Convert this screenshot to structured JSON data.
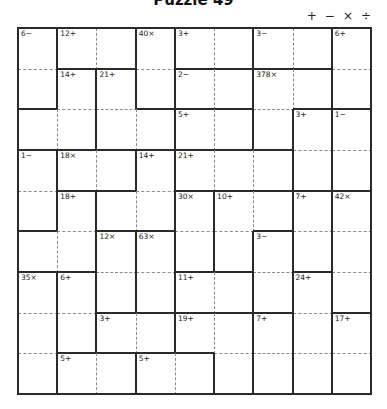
{
  "title": "Puzzle 49",
  "operators": [
    {
      "name": "plus-icon",
      "symbol": "+"
    },
    {
      "name": "minus-icon",
      "symbol": "−"
    },
    {
      "name": "times-icon",
      "symbol": "×"
    },
    {
      "name": "divide-icon",
      "symbol": "÷"
    }
  ],
  "grid": {
    "size": 9,
    "colors": {
      "thick": "#2a2a2a",
      "thin": "#8a8a8a",
      "clue": "#222222",
      "background": "#ffffff"
    },
    "cages": [
      {
        "clue": "6−",
        "cells": [
          [
            0,
            0
          ],
          [
            1,
            0
          ]
        ]
      },
      {
        "clue": "12+",
        "cells": [
          [
            0,
            1
          ],
          [
            0,
            2
          ]
        ]
      },
      {
        "clue": "40×",
        "cells": [
          [
            0,
            3
          ],
          [
            1,
            3
          ]
        ]
      },
      {
        "clue": "3+",
        "cells": [
          [
            0,
            4
          ],
          [
            0,
            5
          ]
        ]
      },
      {
        "clue": "3−",
        "cells": [
          [
            0,
            6
          ],
          [
            0,
            7
          ]
        ]
      },
      {
        "clue": "6+",
        "cells": [
          [
            0,
            8
          ],
          [
            1,
            8
          ]
        ]
      },
      {
        "clue": "14+",
        "cells": [
          [
            1,
            1
          ],
          [
            2,
            1
          ],
          [
            2,
            0
          ]
        ]
      },
      {
        "clue": "21+",
        "cells": [
          [
            1,
            2
          ],
          [
            2,
            2
          ],
          [
            2,
            3
          ]
        ]
      },
      {
        "clue": "2−",
        "cells": [
          [
            1,
            4
          ],
          [
            1,
            5
          ]
        ]
      },
      {
        "clue": "378×",
        "cells": [
          [
            1,
            6
          ],
          [
            1,
            7
          ],
          [
            2,
            6
          ]
        ]
      },
      {
        "clue": "5+",
        "cells": [
          [
            2,
            4
          ],
          [
            2,
            5
          ]
        ]
      },
      {
        "clue": "3+",
        "cells": [
          [
            2,
            7
          ],
          [
            3,
            7
          ]
        ]
      },
      {
        "clue": "1−",
        "cells": [
          [
            2,
            8
          ],
          [
            3,
            8
          ]
        ]
      },
      {
        "clue": "1−",
        "cells": [
          [
            3,
            0
          ],
          [
            4,
            0
          ]
        ]
      },
      {
        "clue": "18×",
        "cells": [
          [
            3,
            1
          ],
          [
            3,
            2
          ]
        ]
      },
      {
        "clue": "14+",
        "cells": [
          [
            3,
            3
          ],
          [
            4,
            3
          ],
          [
            4,
            2
          ]
        ]
      },
      {
        "clue": "21+",
        "cells": [
          [
            3,
            4
          ],
          [
            3,
            5
          ],
          [
            3,
            6
          ]
        ]
      },
      {
        "clue": "18+",
        "cells": [
          [
            4,
            1
          ],
          [
            5,
            1
          ],
          [
            5,
            0
          ]
        ]
      },
      {
        "clue": "30×",
        "cells": [
          [
            4,
            4
          ],
          [
            5,
            4
          ]
        ]
      },
      {
        "clue": "10+",
        "cells": [
          [
            4,
            5
          ],
          [
            4,
            6
          ],
          [
            5,
            5
          ]
        ]
      },
      {
        "clue": "7+",
        "cells": [
          [
            4,
            7
          ],
          [
            5,
            7
          ]
        ]
      },
      {
        "clue": "42×",
        "cells": [
          [
            4,
            8
          ],
          [
            5,
            8
          ],
          [
            6,
            8
          ]
        ]
      },
      {
        "clue": "12×",
        "cells": [
          [
            5,
            2
          ],
          [
            6,
            2
          ]
        ]
      },
      {
        "clue": "63×",
        "cells": [
          [
            5,
            3
          ],
          [
            6,
            3
          ]
        ]
      },
      {
        "clue": "3−",
        "cells": [
          [
            5,
            6
          ],
          [
            6,
            6
          ]
        ]
      },
      {
        "clue": "35×",
        "cells": [
          [
            6,
            0
          ],
          [
            7,
            0
          ],
          [
            8,
            0
          ]
        ]
      },
      {
        "clue": "6+",
        "cells": [
          [
            6,
            1
          ],
          [
            7,
            1
          ]
        ]
      },
      {
        "clue": "11+",
        "cells": [
          [
            6,
            4
          ],
          [
            6,
            5
          ]
        ]
      },
      {
        "clue": "24+",
        "cells": [
          [
            6,
            7
          ],
          [
            7,
            7
          ],
          [
            8,
            7
          ]
        ]
      },
      {
        "clue": "3+",
        "cells": [
          [
            7,
            2
          ],
          [
            7,
            3
          ]
        ]
      },
      {
        "clue": "19+",
        "cells": [
          [
            7,
            4
          ],
          [
            7,
            5
          ],
          [
            8,
            5
          ]
        ]
      },
      {
        "clue": "7+",
        "cells": [
          [
            7,
            6
          ],
          [
            8,
            6
          ]
        ]
      },
      {
        "clue": "17+",
        "cells": [
          [
            7,
            8
          ],
          [
            8,
            8
          ]
        ]
      },
      {
        "clue": "5+",
        "cells": [
          [
            8,
            1
          ],
          [
            8,
            2
          ]
        ]
      },
      {
        "clue": "5+",
        "cells": [
          [
            8,
            3
          ],
          [
            8,
            4
          ]
        ]
      }
    ]
  }
}
